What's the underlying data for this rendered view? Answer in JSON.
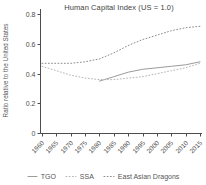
{
  "title": "Human Capital Index (US = 1.0)",
  "chart_data": {
    "type": "line",
    "title": "Human Capital Index (US = 1.0)",
    "xlabel": "",
    "ylabel": "Ratio relative to the United States",
    "x": [
      1960,
      1965,
      1970,
      1975,
      1980,
      1985,
      1990,
      1995,
      2000,
      2005,
      2010,
      2015
    ],
    "series": [
      {
        "name": "TGO",
        "style": "solid",
        "color": "#9b9b9b",
        "values": [
          null,
          null,
          null,
          null,
          0.35,
          0.38,
          0.41,
          0.43,
          0.44,
          0.45,
          0.46,
          0.48
        ]
      },
      {
        "name": "SSA",
        "style": "dotted",
        "color": "#b5b5b5",
        "values": [
          0.45,
          0.42,
          0.39,
          0.37,
          0.36,
          0.36,
          0.37,
          0.38,
          0.4,
          0.42,
          0.44,
          0.47
        ]
      },
      {
        "name": "East Asian Dragons",
        "style": "dotted",
        "color": "#8c8c8c",
        "values": [
          0.47,
          0.47,
          0.47,
          0.48,
          0.5,
          0.54,
          0.59,
          0.63,
          0.66,
          0.69,
          0.71,
          0.72
        ]
      }
    ],
    "ylim": [
      0,
      0.8
    ],
    "yticks": [
      0,
      0.2,
      0.4,
      0.6,
      0.8
    ],
    "ytick_labels": [
      "0",
      "0.2",
      "0.4",
      "0.6",
      "0.8"
    ],
    "grid": false,
    "legend_position": "bottom",
    "axis_color": "#4d4d4d"
  }
}
